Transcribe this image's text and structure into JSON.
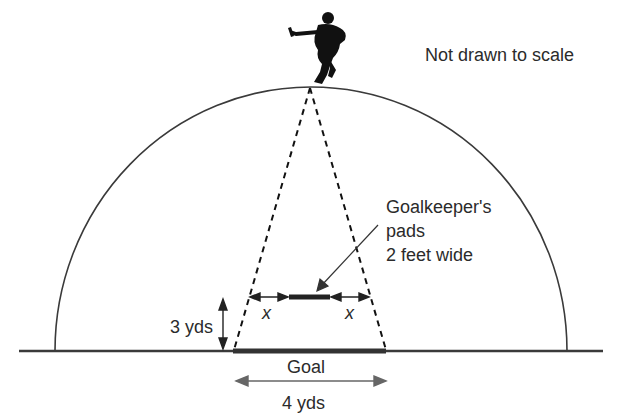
{
  "diagram": {
    "type": "geometry-illustration",
    "note": "Not drawn to scale",
    "pads_label": {
      "line1": "Goalkeeper's",
      "line2": "pads",
      "line3": "2 feet wide"
    },
    "x_left": "x",
    "x_right": "x",
    "distance_label": "3 yds",
    "goal_label": "Goal",
    "goal_width_label": "4 yds",
    "colors": {
      "line": "#3a3a3a",
      "goal_bar": "#333333",
      "silhouette": "#111111",
      "text": "#2b2b2b"
    },
    "icons": {
      "player": "hockey-player-silhouette-icon"
    }
  }
}
